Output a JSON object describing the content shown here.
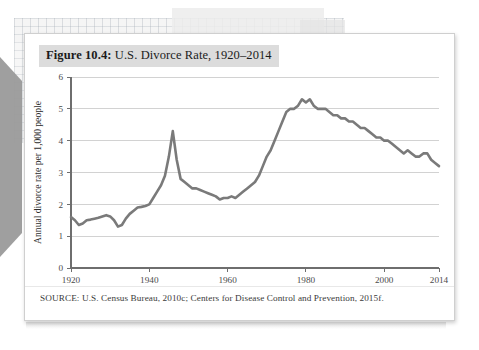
{
  "figure": {
    "number_label": "Figure 10.4:",
    "title_text": " U.S. Divorce Rate, 1920–2014",
    "source": "SOURCE: U.S. Census Bureau, 2010c; Centers for Disease Control and Prevention, 2015f."
  },
  "colors": {
    "line": "#7a7a7a",
    "grid": "#d2d2d2",
    "axis": "#6e6e6e",
    "title_bar": "#dcdcdc",
    "card": "#ffffff",
    "tick_text": "#4a4a4a"
  },
  "chart_data": {
    "type": "line",
    "title": "Figure 10.4: U.S. Divorce Rate, 1920–2014",
    "xlabel": "",
    "ylabel": "Annual divorce rate per 1,000 people",
    "xlim": [
      1920,
      2014
    ],
    "ylim": [
      0,
      6
    ],
    "xticks": [
      1920,
      1940,
      1960,
      1980,
      2000,
      2014
    ],
    "xtick_labels": [
      "1920",
      "1940",
      "1960",
      "1980",
      "2000",
      "2014"
    ],
    "yticks": [
      0,
      1,
      2,
      3,
      4,
      5,
      6
    ],
    "ytick_labels": [
      "0",
      "1",
      "2",
      "3",
      "4",
      "5",
      "6"
    ],
    "grid": "horizontal",
    "legend": "none",
    "series": [
      {
        "name": "Annual divorce rate per 1,000 people",
        "color": "#7a7a7a",
        "x": [
          1920,
          1921,
          1922,
          1923,
          1924,
          1925,
          1926,
          1927,
          1928,
          1929,
          1930,
          1931,
          1932,
          1933,
          1934,
          1935,
          1936,
          1937,
          1938,
          1939,
          1940,
          1941,
          1942,
          1943,
          1944,
          1945,
          1946,
          1947,
          1948,
          1949,
          1950,
          1951,
          1952,
          1953,
          1954,
          1955,
          1956,
          1957,
          1958,
          1959,
          1960,
          1961,
          1962,
          1963,
          1964,
          1965,
          1966,
          1967,
          1968,
          1969,
          1970,
          1971,
          1972,
          1973,
          1974,
          1975,
          1976,
          1977,
          1978,
          1979,
          1980,
          1981,
          1982,
          1983,
          1984,
          1985,
          1986,
          1987,
          1988,
          1989,
          1990,
          1991,
          1992,
          1993,
          1994,
          1995,
          1996,
          1997,
          1998,
          1999,
          2000,
          2001,
          2002,
          2003,
          2004,
          2005,
          2006,
          2007,
          2008,
          2009,
          2010,
          2011,
          2012,
          2013,
          2014
        ],
        "y": [
          1.6,
          1.5,
          1.35,
          1.4,
          1.5,
          1.52,
          1.55,
          1.58,
          1.62,
          1.66,
          1.62,
          1.5,
          1.3,
          1.35,
          1.55,
          1.7,
          1.8,
          1.9,
          1.92,
          1.95,
          2.0,
          2.2,
          2.4,
          2.6,
          2.9,
          3.5,
          4.3,
          3.4,
          2.8,
          2.7,
          2.6,
          2.5,
          2.5,
          2.45,
          2.4,
          2.35,
          2.3,
          2.25,
          2.15,
          2.2,
          2.2,
          2.25,
          2.2,
          2.3,
          2.4,
          2.5,
          2.6,
          2.7,
          2.9,
          3.2,
          3.5,
          3.7,
          4.0,
          4.3,
          4.6,
          4.9,
          5.0,
          5.0,
          5.1,
          5.3,
          5.2,
          5.3,
          5.1,
          5.0,
          5.0,
          5.0,
          4.9,
          4.8,
          4.8,
          4.7,
          4.7,
          4.6,
          4.6,
          4.5,
          4.4,
          4.4,
          4.3,
          4.2,
          4.1,
          4.1,
          4.0,
          4.0,
          3.9,
          3.8,
          3.7,
          3.6,
          3.7,
          3.6,
          3.5,
          3.5,
          3.6,
          3.6,
          3.4,
          3.3,
          3.2
        ],
        "annotations": [
          {
            "year": 1946,
            "value": 4.3,
            "note": "post–World War II peak"
          },
          {
            "year": 1932,
            "value": 1.3,
            "note": "Great Depression low"
          },
          {
            "year": 1979,
            "value": 5.3,
            "note": "all-time high"
          },
          {
            "year": 2014,
            "value": 3.2,
            "note": "end of series"
          }
        ]
      }
    ]
  }
}
